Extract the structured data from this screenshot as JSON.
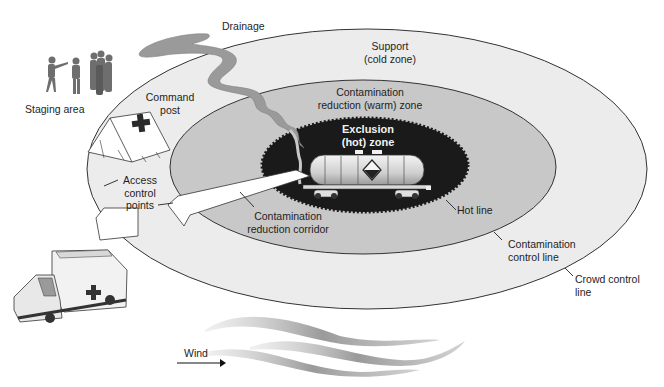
{
  "diagram": {
    "type": "hazmat-incident-zones",
    "colors": {
      "background": "#ffffff",
      "cold_zone_fill": "#ececec",
      "warm_zone_fill": "#c8c8c8",
      "hot_zone_fill": "#1a1a1a",
      "drainage_fill": "#9a9a9a",
      "outline": "#333333",
      "corridor_fill": "#ffffff",
      "hot_text": "#f2f2f2"
    },
    "labels": {
      "drainage": "Drainage",
      "support_line1": "Support",
      "support_line2": "(cold zone)",
      "staging_area": "Staging area",
      "command_post_line1": "Command",
      "command_post_line2": "post",
      "warm_line1": "Contamination",
      "warm_line2": "reduction (warm) zone",
      "exclusion_line1": "Exclusion",
      "exclusion_line2": "(hot) zone",
      "access_line1": "Access",
      "access_line2": "control",
      "access_line3": "points",
      "corridor_line1": "Contamination",
      "corridor_line2": "reduction corridor",
      "hot_line": "Hot line",
      "contam_control_line1": "Contamination",
      "contam_control_line2": "control line",
      "crowd_control_line1": "Crowd control",
      "crowd_control_line2": "line",
      "wind": "Wind"
    },
    "zones": [
      {
        "name": "Support (cold zone)",
        "boundary": "Crowd control line"
      },
      {
        "name": "Contamination reduction (warm) zone",
        "boundary": "Contamination control line"
      },
      {
        "name": "Exclusion (hot) zone",
        "boundary": "Hot line"
      }
    ]
  }
}
